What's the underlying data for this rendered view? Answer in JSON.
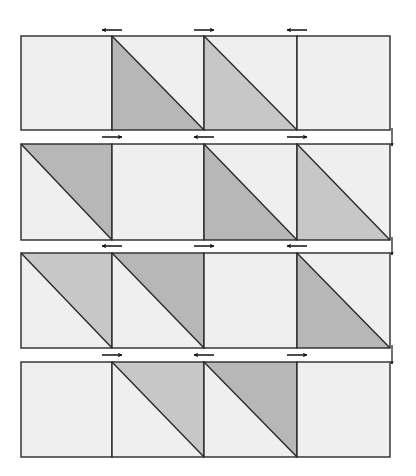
{
  "diagram": {
    "colors": {
      "background": "#efefef",
      "dark": "#b7b7b7",
      "light": "#c7c7c7",
      "stroke": "#2a2a2a",
      "arrow": "#111111"
    },
    "grid": {
      "x": [
        21,
        112,
        204,
        297,
        390
      ],
      "rows": [
        {
          "y0": 36,
          "y1": 130
        },
        {
          "y0": 144,
          "y1": 240
        },
        {
          "y0": 253,
          "y1": 348
        },
        {
          "y0": 362,
          "y1": 457
        }
      ]
    },
    "rows": [
      {
        "name": "row-1",
        "squares": [
          {
            "type": "plain"
          },
          {
            "type": "lower-left",
            "shade": "dark"
          },
          {
            "type": "lower-left",
            "shade": "light"
          },
          {
            "type": "plain"
          }
        ]
      },
      {
        "name": "row-2",
        "squares": [
          {
            "type": "upper-right",
            "shade": "dark"
          },
          {
            "type": "plain"
          },
          {
            "type": "lower-left",
            "shade": "dark"
          },
          {
            "type": "lower-left",
            "shade": "light"
          }
        ]
      },
      {
        "name": "row-3",
        "squares": [
          {
            "type": "upper-right",
            "shade": "light"
          },
          {
            "type": "upper-right",
            "shade": "dark"
          },
          {
            "type": "plain"
          },
          {
            "type": "lower-left",
            "shade": "dark"
          }
        ]
      },
      {
        "name": "row-4",
        "squares": [
          {
            "type": "plain"
          },
          {
            "type": "upper-right",
            "shade": "light"
          },
          {
            "type": "upper-right",
            "shade": "dark"
          },
          {
            "type": "plain"
          }
        ]
      }
    ],
    "pressing_arrows": [
      {
        "y": 30,
        "dirs": [
          "left",
          "right",
          "left"
        ]
      },
      {
        "y": 137,
        "dirs": [
          "right",
          "left",
          "right"
        ]
      },
      {
        "y": 246,
        "dirs": [
          "left",
          "right",
          "left"
        ]
      },
      {
        "y": 355,
        "dirs": [
          "right",
          "left",
          "right"
        ]
      }
    ],
    "down_arrows": [
      {
        "y0": 128,
        "y1": 146
      },
      {
        "y0": 237,
        "y1": 255
      },
      {
        "y0": 345,
        "y1": 364
      }
    ],
    "down_arrow_x": 392
  }
}
